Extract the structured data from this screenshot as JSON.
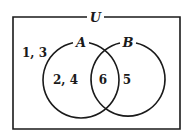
{
  "diagram": {
    "type": "venn",
    "universe": {
      "label": "U",
      "outside_elements": "1,  3"
    },
    "sets": [
      {
        "label": "A",
        "only_elements": "2,  4"
      },
      {
        "label": "B",
        "only_elements": "5"
      }
    ],
    "intersection": {
      "elements": "6"
    },
    "colors": {
      "stroke": "#1a1a1a",
      "background": "#ffffff"
    }
  }
}
